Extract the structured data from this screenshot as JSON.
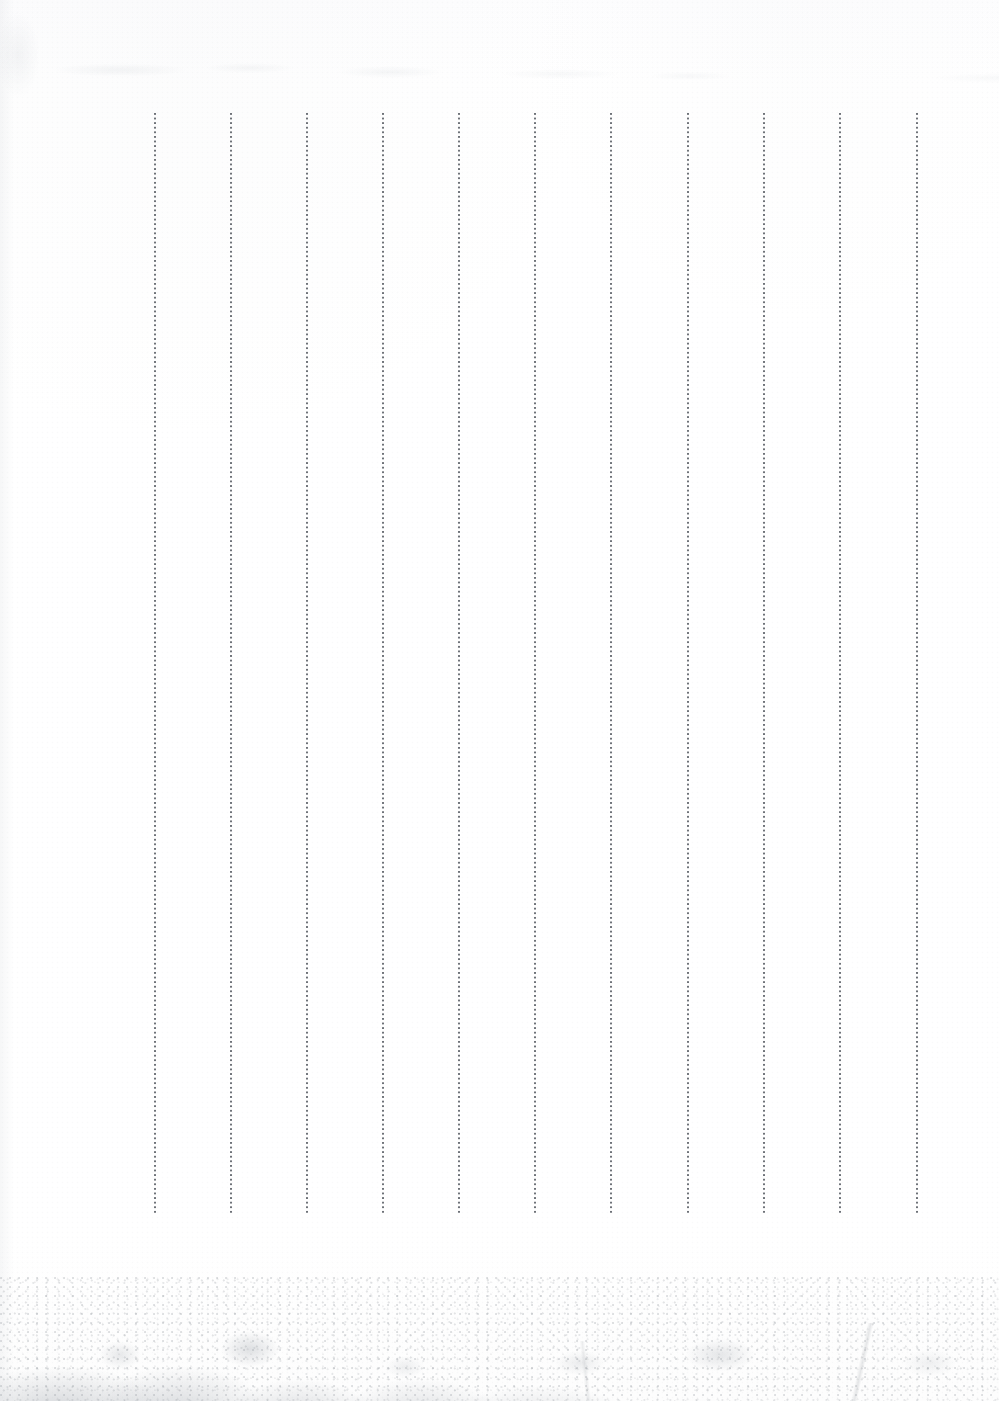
{
  "page": {
    "kind": "blank-ruled-notebook-page-scan",
    "width_px": 999,
    "height_px": 1401,
    "background_color": "#ffffff",
    "text_content": "",
    "visible_text": []
  },
  "ruling": {
    "orientation": "vertical",
    "style": "dotted",
    "line_count": 11,
    "line_color": "#6e7278",
    "line_width_px": 2,
    "dot_pitch_px": 4.6,
    "top_y_px": 113,
    "bottom_y_px": 1215,
    "height_px": 1102,
    "spacing_px": 76.2,
    "x_positions": [
      155,
      231,
      307,
      383,
      459,
      535,
      611,
      688,
      764,
      840,
      917
    ]
  },
  "artifacts": {
    "bottom_stain": {
      "name": "gray-smudge",
      "color": "#969ca4",
      "region": "bottom edge, strongest at left, fading to the right",
      "top_y_px": 1288,
      "bottom_y_px": 1401
    },
    "top_blemish": {
      "name": "faint-gray-marks",
      "color": "#a0a8b0",
      "region": "upper-left band",
      "top_y_px": 55,
      "bottom_y_px": 90
    }
  }
}
